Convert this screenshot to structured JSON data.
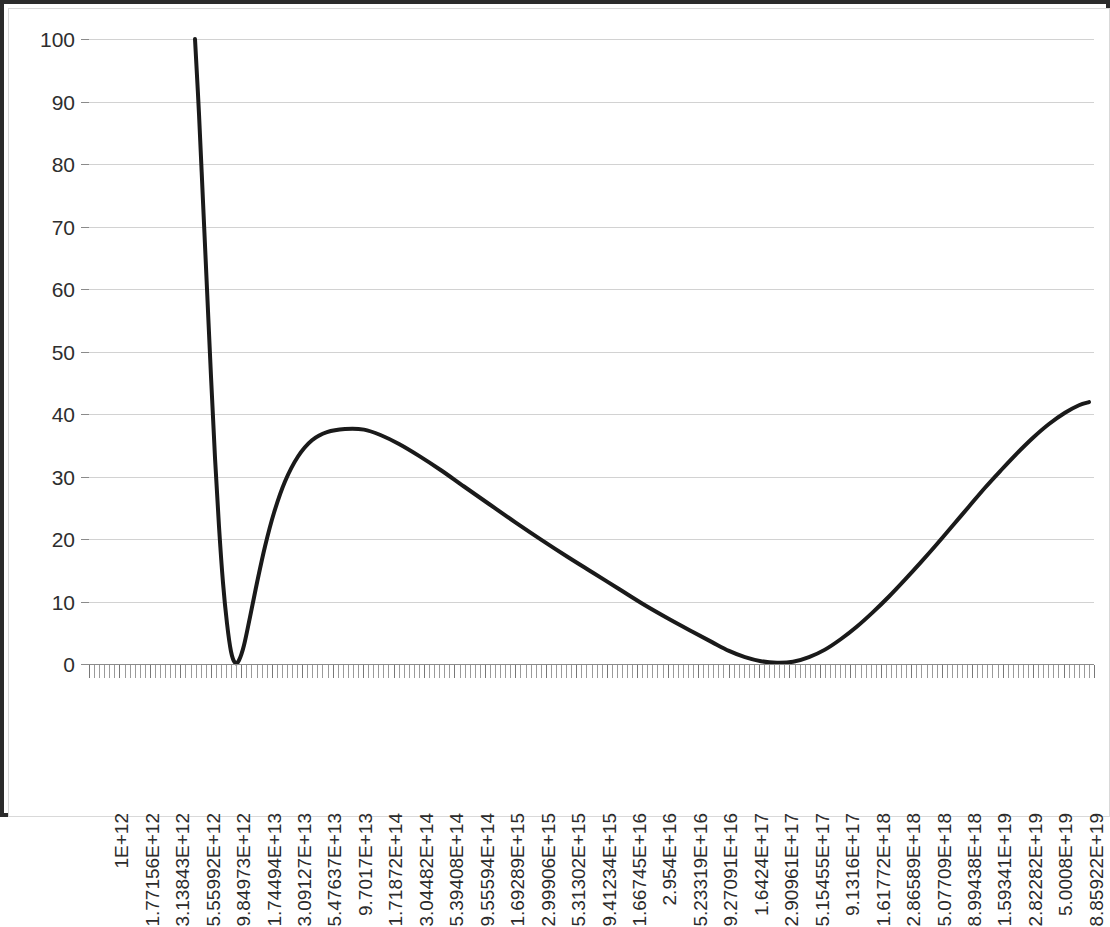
{
  "chart_data": {
    "type": "line",
    "title": "",
    "subtitle": "",
    "xlabel": "",
    "ylabel": "",
    "legend": [],
    "grid": true,
    "ylim": [
      0,
      100
    ],
    "yticks": [
      0,
      10,
      20,
      30,
      40,
      50,
      60,
      70,
      80,
      90,
      100
    ],
    "ytick_labels": [
      "0",
      "10",
      "20",
      "30",
      "40",
      "50",
      "60",
      "70",
      "80",
      "90",
      "100"
    ],
    "x_axis_scale": "log",
    "x_tick_labels": [
      "1E+12",
      "1.77156E+12",
      "3.13843E+12",
      "5.55992E+12",
      "9.84973E+12",
      "1.74494E+13",
      "3.09127E+13",
      "5.47637E+13",
      "9.7017E+13",
      "1.71872E+14",
      "3.04482E+14",
      "5.39408E+14",
      "9.55594E+14",
      "1.69289E+15",
      "2.99906E+15",
      "5.31302E+15",
      "9.41234E+15",
      "1.66745E+16",
      "2.954E+16",
      "5.23319E+16",
      "9.27091E+16",
      "1.6424E+17",
      "2.90961E+17",
      "5.15455E+17",
      "9.1316E+17",
      "1.61772E+18",
      "2.86589E+18",
      "5.07709E+18",
      "8.99438E+18",
      "1.59341E+19",
      "2.82282E+19",
      "5.0008E+19",
      "8.85922E+19"
    ],
    "x_tick_labels_shown": [
      "1E+12",
      "1.77156E+12",
      "3.13843E+12",
      "5.55992E+12",
      "9.84973E+12",
      "1.74494E+13",
      "3.09127E+13",
      "5.47637E+13",
      "9.7017E+13",
      "1.71872E+14",
      "3.04482E+14",
      "5.39408E+14",
      "9.55594E+14",
      "1.69289E+15",
      "2.99906E+15",
      "5.31302E+15",
      "9.41234E+15",
      "1.66745E+16",
      "2.954E+16",
      "5.23319E+16",
      "9.27091E+16",
      "1.6424E+17",
      "2.90961E+17",
      "5.15455E+17",
      "9.1316E+17",
      "1.61772E+18",
      "2.86589E+18",
      "5.07709E+18",
      "8.99438E+18",
      "1.59341E+19",
      "2.82282E+19",
      "5.0008E+19",
      "8.85922E+19"
    ],
    "series": [
      {
        "name": "curve",
        "color": "#1a1a1a",
        "line_width": 4,
        "points_px": [
          [
            186,
            100.0
          ],
          [
            190,
            88.0
          ],
          [
            194,
            74.0
          ],
          [
            198,
            60.0
          ],
          [
            202,
            46.0
          ],
          [
            206,
            33.0
          ],
          [
            210,
            22.0
          ],
          [
            214,
            13.0
          ],
          [
            218,
            6.5
          ],
          [
            222,
            2.0
          ],
          [
            226,
            0.2
          ],
          [
            230,
            0.6
          ],
          [
            235,
            3.0
          ],
          [
            241,
            7.5
          ],
          [
            248,
            13.0
          ],
          [
            256,
            18.8
          ],
          [
            265,
            24.2
          ],
          [
            276,
            29.2
          ],
          [
            289,
            33.2
          ],
          [
            303,
            35.8
          ],
          [
            318,
            37.1
          ],
          [
            336,
            37.6
          ],
          [
            355,
            37.5
          ],
          [
            372,
            36.6
          ],
          [
            390,
            35.2
          ],
          [
            410,
            33.3
          ],
          [
            432,
            31.0
          ],
          [
            455,
            28.4
          ],
          [
            480,
            25.6
          ],
          [
            506,
            22.7
          ],
          [
            532,
            19.9
          ],
          [
            558,
            17.2
          ],
          [
            584,
            14.6
          ],
          [
            610,
            12.0
          ],
          [
            636,
            9.4
          ],
          [
            660,
            7.2
          ],
          [
            683,
            5.2
          ],
          [
            703,
            3.5
          ],
          [
            720,
            2.1
          ],
          [
            736,
            1.1
          ],
          [
            752,
            0.45
          ],
          [
            768,
            0.2
          ],
          [
            784,
            0.35
          ],
          [
            800,
            1.1
          ],
          [
            816,
            2.3
          ],
          [
            832,
            4.0
          ],
          [
            848,
            6.0
          ],
          [
            864,
            8.3
          ],
          [
            880,
            10.8
          ],
          [
            896,
            13.5
          ],
          [
            912,
            16.3
          ],
          [
            928,
            19.2
          ],
          [
            944,
            22.2
          ],
          [
            960,
            25.2
          ],
          [
            976,
            28.2
          ],
          [
            992,
            31.0
          ],
          [
            1008,
            33.7
          ],
          [
            1024,
            36.2
          ],
          [
            1040,
            38.4
          ],
          [
            1056,
            40.2
          ],
          [
            1070,
            41.4
          ],
          [
            1080,
            41.9
          ]
        ]
      }
    ]
  },
  "axes": {
    "plot_left_px": 80,
    "plot_top_px": 30,
    "plot_width_px": 1005,
    "plot_height_px": 625,
    "grid_color": "#d2d2d2",
    "axis_color": "#8a8a8a",
    "border_color": "#2b2b2b",
    "background": "#ffffff",
    "minor_ticks_per_label": 6
  }
}
